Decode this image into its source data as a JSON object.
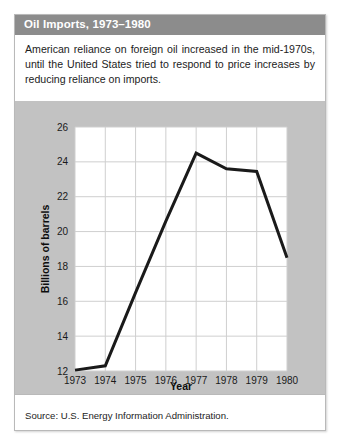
{
  "figure": {
    "title": "Oil Imports, 1973–1980",
    "caption": "American reliance on foreign oil increased in the mid-1970s, until the United States tried to respond to price increases by reducing reliance on imports.",
    "source": "Source: U.S. Energy Information Administration.",
    "title_band_color": "#8c8c8c",
    "panel_color": "#c2c2c2",
    "plot_background": "#ffffff",
    "line_color": "#1a1a1a",
    "grid_color": "#cfcfcf",
    "card_border_color": "#b9b9b9"
  },
  "chart_data": {
    "type": "line",
    "title": "Oil Imports, 1973–1980",
    "xlabel": "Year",
    "ylabel": "Billions of barrels",
    "x": [
      1973,
      1974,
      1975,
      1976,
      1977,
      1978,
      1979,
      1980
    ],
    "categories": [
      "1973",
      "1974",
      "1975",
      "1976",
      "1977",
      "1978",
      "1979",
      "1980"
    ],
    "values": [
      12.05,
      12.3,
      16.5,
      20.6,
      24.5,
      23.6,
      23.45,
      18.5
    ],
    "series": [
      {
        "name": "Oil imports",
        "values": [
          12.05,
          12.3,
          16.5,
          20.6,
          24.5,
          23.6,
          23.45,
          18.5
        ]
      }
    ],
    "ylim": [
      12,
      26
    ],
    "yticks": [
      12,
      14,
      16,
      18,
      20,
      22,
      24,
      26
    ],
    "ytick_labels": [
      "12",
      "14",
      "16",
      "18",
      "20",
      "22",
      "24",
      "26"
    ],
    "xtick_labels": [
      "1973",
      "1974",
      "1975",
      "1976",
      "1977",
      "1978",
      "1979",
      "1980"
    ],
    "grid": true,
    "grid_axis": "both",
    "legend": false,
    "legend_position": "none"
  }
}
